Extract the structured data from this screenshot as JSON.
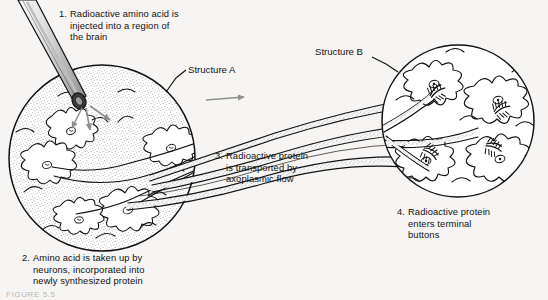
{
  "figure": {
    "background_color": "#f6f5f3",
    "ink_color": "#111111",
    "arrow_color": "#8f8f8f",
    "caption_bottom": "FIGURE 5.5"
  },
  "labels": {
    "structure_a": "Structure A",
    "structure_b": "Structure B"
  },
  "steps": [
    {
      "number": "1.",
      "lines": [
        "Radioactive amino acid is",
        "injected into a region of",
        "the brain"
      ]
    },
    {
      "number": "2.",
      "lines": [
        "Amino acid is taken up by",
        "neurons, incorporated into",
        "newly synthesized protein"
      ]
    },
    {
      "number": "3.",
      "lines": [
        "Radioactive protein",
        "is transported by",
        "axoplasmic flow"
      ]
    },
    {
      "number": "4.",
      "lines": [
        "Radioactive protein",
        "enters terminal",
        "buttons"
      ]
    }
  ],
  "elements": {
    "syringe": "syringe-needle-icon",
    "diffusion_arrows": "diffusion-arrows-icon",
    "transport_arrow": "rightward-transport-arrow-icon",
    "structure_a_circle": "structure-a-circle",
    "structure_b_circle": "structure-b-circle",
    "axon_bundle": "axon-bundle",
    "terminal_buttons": "terminal-buttons"
  }
}
